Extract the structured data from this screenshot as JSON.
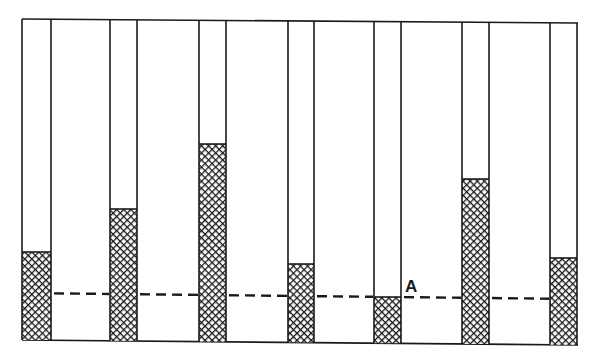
{
  "diagram": {
    "title": "",
    "colors": {
      "line": "#1a1a1a",
      "background": "#ffffff",
      "fill_pattern": "crosshatch"
    },
    "frame": {
      "x1": 22,
      "y_top_left": 19,
      "x2": 578,
      "y_top_right": 23,
      "y_bottom_left": 340,
      "y_bottom_right": 345
    },
    "reference_line": {
      "label": "A",
      "style": "dashed",
      "y_left": 293,
      "y_right": 299,
      "label_position": {
        "x": 405,
        "y": 292
      }
    },
    "tubes": [
      {
        "index": 1,
        "x": 22,
        "width": 29,
        "fill_top": 252
      },
      {
        "index": 2,
        "x": 110,
        "width": 27,
        "fill_top": 209
      },
      {
        "index": 3,
        "x": 199,
        "width": 27,
        "fill_top": 144
      },
      {
        "index": 4,
        "x": 288,
        "width": 26,
        "fill_top": 264
      },
      {
        "index": 5,
        "x": 374,
        "width": 27,
        "fill_top": 297
      },
      {
        "index": 6,
        "x": 462,
        "width": 27,
        "fill_top": 179
      },
      {
        "index": 7,
        "x": 550,
        "width": 27,
        "fill_top": 258
      }
    ]
  }
}
